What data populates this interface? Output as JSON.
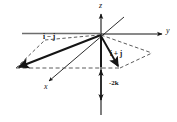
{
  "figure": {
    "background_color": "#ffffff",
    "line_color": "#151515",
    "dashed_color": "#4a4a4a",
    "axes": {
      "z_label": "z",
      "y_label": "y",
      "x_label": "x"
    },
    "vectors": [
      {
        "name": "i-j",
        "label": "i − j"
      },
      {
        "name": "i+j",
        "label": "i + j"
      },
      {
        "name": "-2k",
        "label": "-2k"
      }
    ],
    "labels": {
      "z": "z",
      "y": "y",
      "x": "x",
      "i_minus_j": "i − j",
      "i_plus_j": "i + j",
      "minus_2k": "-2k"
    }
  }
}
